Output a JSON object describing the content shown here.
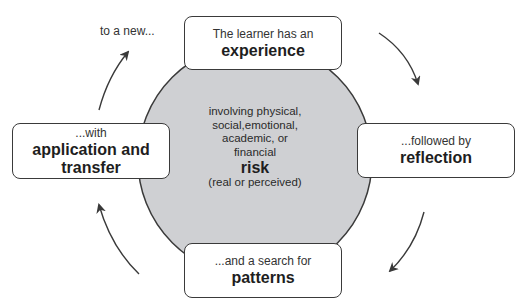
{
  "diagram": {
    "type": "cycle",
    "colors": {
      "circle_fill": "#cfd0d3",
      "stroke": "#3a3a3a",
      "box_fill": "#ffffff",
      "text": "#1e1e1e"
    },
    "center": {
      "lines": [
        "involving physical,",
        "social,emotional,",
        "academic, or",
        "financial"
      ],
      "emphasis": "risk",
      "note": "(real or perceived)"
    },
    "nodes": [
      {
        "id": "experience",
        "prefix": "The learner has an",
        "title": "experience"
      },
      {
        "id": "reflection",
        "prefix": "...followed by",
        "title": "reflection"
      },
      {
        "id": "patterns",
        "prefix": "...and a search for",
        "title": "patterns"
      },
      {
        "id": "application",
        "prefix": "...with",
        "title": "application and transfer",
        "title_lines": [
          "application and",
          "transfer"
        ]
      }
    ],
    "loop_label": "to a new...",
    "arrows": [
      {
        "from": "experience",
        "to": "reflection",
        "direction": "clockwise"
      },
      {
        "from": "reflection",
        "to": "patterns",
        "direction": "clockwise"
      },
      {
        "from": "patterns",
        "to": "application",
        "direction": "clockwise"
      },
      {
        "from": "application",
        "to": "experience",
        "direction": "clockwise"
      }
    ]
  }
}
